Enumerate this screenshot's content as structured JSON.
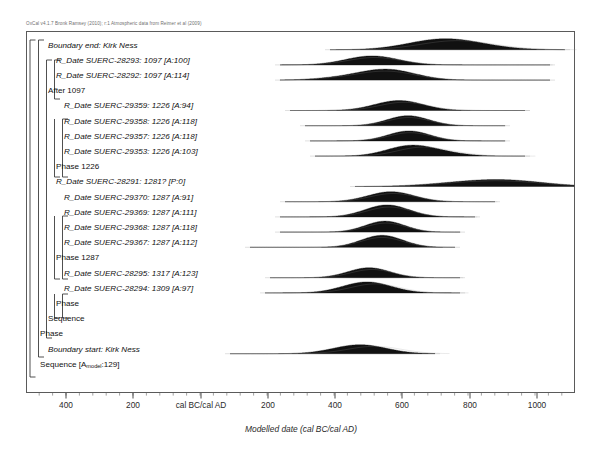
{
  "header": {
    "credit": "OxCal v4.1.7 Bronk Ramsey (2010); r:1 Atmospheric data from Reimer et al (2009)"
  },
  "axis": {
    "title": "Modelled date (cal BC/cal AD)",
    "ticks": [
      {
        "label": "400",
        "x": 66
      },
      {
        "label": "200",
        "x": 133
      },
      {
        "label": "cal BC/cal AD",
        "x": 201
      },
      {
        "label": "200",
        "x": 268
      },
      {
        "label": "400",
        "x": 335
      },
      {
        "label": "600",
        "x": 402
      },
      {
        "label": "800",
        "x": 470
      },
      {
        "label": "1000",
        "x": 537
      }
    ]
  },
  "rows": [
    {
      "label": "Boundary end: Kirk Ness",
      "style": "ital",
      "indent": 1
    },
    {
      "label": "R_Date SUERC-28293: 1097 [A:100]",
      "style": "ital",
      "indent": 2
    },
    {
      "label": "R_Date SUERC-28292: 1097 [A:114]",
      "style": "ital",
      "indent": 2
    },
    {
      "label": "After 1097",
      "style": "up",
      "indent": 1
    },
    {
      "label": "R_Date SUERC-29359: 1226 [A:94]",
      "style": "ital",
      "indent": 3
    },
    {
      "label": "R_Date SUERC-29358: 1226 [A:118]",
      "style": "ital",
      "indent": 3
    },
    {
      "label": "R_Date SUERC-29357: 1226 [A:118]",
      "style": "ital",
      "indent": 3
    },
    {
      "label": "R_Date SUERC-29353: 1226 [A:103]",
      "style": "ital",
      "indent": 3
    },
    {
      "label": "Phase 1226",
      "style": "up",
      "indent": 2
    },
    {
      "label": "R_Date SUERC-28291: 1281? [P:0]",
      "style": "ital",
      "indent": 2
    },
    {
      "label": "R_Date SUERC-29370: 1287 [A:91]",
      "style": "ital",
      "indent": 3
    },
    {
      "label": "R_Date SUERC-29369: 1287 [A:111]",
      "style": "ital",
      "indent": 3
    },
    {
      "label": "R_Date SUERC-29368: 1287 [A:118]",
      "style": "ital",
      "indent": 3
    },
    {
      "label": "R_Date SUERC-29367: 1287 [A:112]",
      "style": "ital",
      "indent": 3
    },
    {
      "label": "Phase 1287",
      "style": "up",
      "indent": 2
    },
    {
      "label": "R_Date SUERC-28295: 1317 [A:123]",
      "style": "ital",
      "indent": 3
    },
    {
      "label": "R_Date SUERC-28294: 1309 [A:97]",
      "style": "ital",
      "indent": 3
    },
    {
      "label": "Phase",
      "style": "up",
      "indent": 2
    },
    {
      "label": "Sequence",
      "style": "up",
      "indent": 1
    },
    {
      "label": "Phase",
      "style": "up",
      "indent": 0
    },
    {
      "label": "Boundary start: Kirk Ness",
      "style": "ital",
      "indent": 1
    },
    {
      "label": "Sequence [Amodel:129]",
      "style": "up",
      "indent": 0,
      "rich": {
        "pre": "Sequence [A",
        "subscript": "model",
        "post": ":129]"
      }
    }
  ],
  "chart_data": {
    "type": "area",
    "xlabel": "Modelled date (cal BC/cal AD)",
    "ylabel": "",
    "xlim_px": [
      26,
      575
    ],
    "axis_ticks": [
      {
        "label": "400",
        "value": -400
      },
      {
        "label": "200",
        "value": -200
      },
      {
        "label": "cal BC/cal AD",
        "value": 0
      },
      {
        "label": "200",
        "value": 200
      },
      {
        "label": "400",
        "value": 400
      },
      {
        "label": "600",
        "value": 600
      },
      {
        "label": "800",
        "value": 800
      },
      {
        "label": "1000",
        "value": 1000
      }
    ],
    "grid": false,
    "legend": null,
    "series": [
      {
        "name": "Boundary end: Kirk Ness",
        "peak_x": 445,
        "width": 150,
        "height": 11,
        "skew": 0.35,
        "tail_left": 380,
        "tail_right": 560,
        "modes": [
          {
            "x": 437,
            "h": 1.0
          },
          {
            "x": 470,
            "h": 0.45
          }
        ]
      },
      {
        "name": "R_Date SUERC-28293: 1097 [A:100]",
        "peak_x": 373,
        "width": 120,
        "height": 9,
        "skew": 0.1,
        "tail_left": 330,
        "tail_right": 545,
        "modes": [
          {
            "x": 372,
            "h": 1.0
          }
        ]
      },
      {
        "name": "R_Date SUERC-28292: 1097 [A:114]",
        "peak_x": 389,
        "width": 125,
        "height": 11,
        "skew": 0.0,
        "tail_left": 330,
        "tail_right": 545,
        "modes": [
          {
            "x": 388,
            "h": 1.0
          },
          {
            "x": 344,
            "h": 0.22
          }
        ]
      },
      {
        "name": "After 1097",
        "peak_x": 0,
        "width": 0,
        "height": 0,
        "skew": 0,
        "tail_left": 0,
        "tail_right": 0,
        "modes": []
      },
      {
        "name": "R_Date SUERC-29359: 1226 [A:94]",
        "peak_x": 400,
        "width": 110,
        "height": 10,
        "skew": 0.2,
        "tail_left": 340,
        "tail_right": 520,
        "modes": [
          {
            "x": 399,
            "h": 1.0
          }
        ]
      },
      {
        "name": "R_Date SUERC-29358: 1226 [A:118]",
        "peak_x": 409,
        "width": 95,
        "height": 10,
        "skew": 0.05,
        "tail_left": 355,
        "tail_right": 500,
        "modes": [
          {
            "x": 408,
            "h": 1.0
          }
        ]
      },
      {
        "name": "R_Date SUERC-29357: 1226 [A:118]",
        "peak_x": 410,
        "width": 95,
        "height": 10,
        "skew": 0.05,
        "tail_left": 360,
        "tail_right": 500,
        "modes": [
          {
            "x": 409,
            "h": 1.0
          }
        ]
      },
      {
        "name": "R_Date SUERC-29353: 1226 [A:103]",
        "peak_x": 411,
        "width": 105,
        "height": 11,
        "skew": 0.45,
        "tail_left": 365,
        "tail_right": 520,
        "modes": [
          {
            "x": 409,
            "h": 1.0
          },
          {
            "x": 442,
            "h": 0.3
          }
        ]
      },
      {
        "name": "Phase 1226",
        "peak_x": 0,
        "width": 0,
        "height": 0,
        "skew": 0,
        "tail_left": 0,
        "tail_right": 0,
        "modes": []
      },
      {
        "name": "R_Date SUERC-28291: 1281? [P:0]",
        "peak_x": 490,
        "width": 175,
        "height": 7,
        "skew": 0.0,
        "tail_left": 405,
        "tail_right": 575,
        "modes": [
          {
            "x": 455,
            "h": 0.75
          },
          {
            "x": 487,
            "h": 0.85
          },
          {
            "x": 505,
            "h": 1.0
          },
          {
            "x": 520,
            "h": 0.8
          }
        ]
      },
      {
        "name": "R_Date SUERC-29370: 1287 [A:91]",
        "peak_x": 392,
        "width": 105,
        "height": 10,
        "skew": 0.1,
        "tail_left": 335,
        "tail_right": 490,
        "modes": [
          {
            "x": 391,
            "h": 1.0
          }
        ]
      },
      {
        "name": "R_Date SUERC-29369: 1287 [A:111]",
        "peak_x": 388,
        "width": 100,
        "height": 12,
        "skew": 0.1,
        "tail_left": 330,
        "tail_right": 470,
        "modes": [
          {
            "x": 387,
            "h": 1.0
          }
        ]
      },
      {
        "name": "R_Date SUERC-29368: 1287 [A:118]",
        "peak_x": 386,
        "width": 90,
        "height": 11,
        "skew": 0.05,
        "tail_left": 330,
        "tail_right": 455,
        "modes": [
          {
            "x": 385,
            "h": 1.0
          }
        ]
      },
      {
        "name": "R_Date SUERC-29367: 1287 [A:112]",
        "peak_x": 383,
        "width": 95,
        "height": 12,
        "skew": 0.0,
        "tail_left": 300,
        "tail_right": 450,
        "modes": [
          {
            "x": 382,
            "h": 1.0
          }
        ]
      },
      {
        "name": "Phase 1287",
        "peak_x": 0,
        "width": 0,
        "height": 0,
        "skew": 0,
        "tail_left": 0,
        "tail_right": 0,
        "modes": []
      },
      {
        "name": "R_Date SUERC-28295: 1317 [A:123]",
        "peak_x": 370,
        "width": 95,
        "height": 10,
        "skew": 0.15,
        "tail_left": 320,
        "tail_right": 455,
        "modes": [
          {
            "x": 369,
            "h": 1.0
          }
        ]
      },
      {
        "name": "R_Date SUERC-28294: 1309 [A:97]",
        "peak_x": 368,
        "width": 110,
        "height": 11,
        "skew": 0.35,
        "tail_left": 315,
        "tail_right": 455,
        "modes": [
          {
            "x": 367,
            "h": 1.0
          }
        ]
      },
      {
        "name": "Phase",
        "peak_x": 0,
        "width": 0,
        "height": 0,
        "skew": 0,
        "tail_left": 0,
        "tail_right": 0,
        "modes": []
      },
      {
        "name": "Sequence",
        "peak_x": 0,
        "width": 0,
        "height": 0,
        "skew": 0,
        "tail_left": 0,
        "tail_right": 0,
        "modes": []
      },
      {
        "name": "Phase",
        "peak_x": 0,
        "width": 0,
        "height": 0,
        "skew": 0,
        "tail_left": 0,
        "tail_right": 0,
        "modes": []
      },
      {
        "name": "Boundary start: Kirk Ness",
        "peak_x": 362,
        "width": 120,
        "height": 9,
        "skew": 0.55,
        "tail_left": 280,
        "tail_right": 430,
        "modes": [
          {
            "x": 360,
            "h": 1.0
          }
        ]
      },
      {
        "name": "Sequence [Amodel:129]",
        "peak_x": 0,
        "width": 0,
        "height": 0,
        "skew": 0,
        "tail_left": 0,
        "tail_right": 0,
        "modes": []
      }
    ]
  },
  "brackets": [
    {
      "name": "outer-sequence",
      "x": 30,
      "y1": 40,
      "y2": 377,
      "tick_top": true,
      "tick_bottom": true
    },
    {
      "name": "phase-outer",
      "x": 38.5,
      "y1": 40,
      "y2": 357,
      "tick_top": true,
      "tick_bottom": true
    },
    {
      "name": "sequence-inner",
      "x": 46.5,
      "y1": 60,
      "y2": 338,
      "tick_top": true,
      "tick_bottom": true
    },
    {
      "name": "phase-1097",
      "x": 54.5,
      "y1": 60,
      "y2": 99,
      "tick_top": true,
      "tick_bottom": true
    },
    {
      "name": "phase-1226",
      "x": 54.5,
      "y1": 119,
      "y2": 177,
      "tick_top": false,
      "tick_bottom": true
    },
    {
      "name": "phase-1226-in",
      "x": 62.5,
      "y1": 119,
      "y2": 177,
      "tick_top": true,
      "tick_bottom": true
    },
    {
      "name": "phase-1287",
      "x": 54.5,
      "y1": 216,
      "y2": 279,
      "tick_top": false,
      "tick_bottom": true
    },
    {
      "name": "phase-1287-in",
      "x": 62.5,
      "y1": 216,
      "y2": 279,
      "tick_top": true,
      "tick_bottom": true
    },
    {
      "name": "phase-last",
      "x": 54.5,
      "y1": 294,
      "y2": 318,
      "tick_top": false,
      "tick_bottom": true
    },
    {
      "name": "phase-last-in",
      "x": 62.5,
      "y1": 294,
      "y2": 318,
      "tick_top": true,
      "tick_bottom": true
    }
  ]
}
